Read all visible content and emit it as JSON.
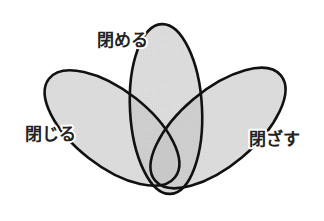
{
  "diagram": {
    "type": "three-petal-venn",
    "colors": {
      "fill": "#bdbdbd",
      "fill_opacity": 0.6,
      "outline": "#111111",
      "background": "#ffffff"
    },
    "sets": [
      {
        "id": "left",
        "label": "閉じる"
      },
      {
        "id": "center",
        "label": "閉める"
      },
      {
        "id": "right",
        "label": "閉ざす"
      }
    ]
  }
}
